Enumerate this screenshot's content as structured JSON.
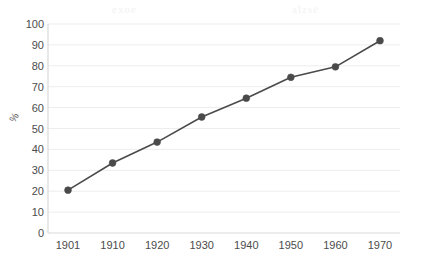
{
  "chart_data": {
    "type": "line",
    "title": "",
    "xlabel": "",
    "ylabel": "%",
    "categories": [
      "1901",
      "1910",
      "1920",
      "1930",
      "1940",
      "1950",
      "1960",
      "1970"
    ],
    "x": [
      1901,
      1910,
      1920,
      1930,
      1940,
      1950,
      1960,
      1970
    ],
    "values": [
      20.5,
      33.5,
      43.5,
      55.5,
      64.5,
      74.5,
      79.5,
      92
    ],
    "series": [
      {
        "name": "",
        "values": [
          20.5,
          33.5,
          43.5,
          55.5,
          64.5,
          74.5,
          79.5,
          92
        ]
      }
    ],
    "ylim": [
      0,
      100
    ],
    "ytick_labels": [
      "0",
      "10",
      "20",
      "30",
      "40",
      "50",
      "60",
      "70",
      "80",
      "90",
      "100"
    ],
    "ytick_values": [
      0,
      10,
      20,
      30,
      40,
      50,
      60,
      70,
      80,
      90,
      100
    ],
    "grid": "horizontal",
    "legend": "none",
    "marker": "circle",
    "line_color": "#4a4a4a",
    "marker_color": "#4a4a4a",
    "grid_color": "#ededee",
    "axis_color": "#d9d9da",
    "tick_label_color": "#4c4c4c",
    "background_color": "#ffffff"
  },
  "watermarks": {
    "left": "exoe",
    "right": "alzse"
  }
}
